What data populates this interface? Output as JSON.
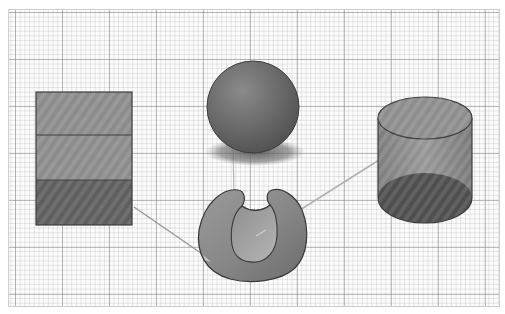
{
  "canvas": {
    "background": "graph-paper",
    "grid_major_color": "#8a8a8a",
    "grid_minor_color": "#c8c8c8"
  },
  "shapes": [
    {
      "name": "rectangular-prism",
      "fill": "#8c8c8c",
      "bottom_fill": "#5e5e5e"
    },
    {
      "name": "sphere",
      "fill": "#6e6e6e",
      "shadow": "#7a7a7a"
    },
    {
      "name": "cylinder",
      "fill": "#8a8a8a",
      "base_fill": "#4e4e4e"
    },
    {
      "name": "cut-hemisphere",
      "fill": "#8e8e8e",
      "inner_fill": "#a8a8a8"
    }
  ],
  "connectors": [
    {
      "from": "rectangular-prism",
      "to": "cut-hemisphere"
    },
    {
      "from": "cylinder",
      "to": "cut-hemisphere"
    },
    {
      "from": "sphere",
      "to": "cut-hemisphere"
    }
  ]
}
